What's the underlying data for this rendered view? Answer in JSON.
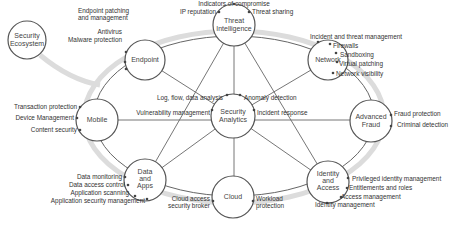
{
  "diagram": {
    "colors": {
      "ring": "#d9d9d9",
      "line": "#555555",
      "node_stroke": "#555555",
      "node_fill": "#ffffff",
      "dot": "#444444",
      "text": "#333333"
    },
    "nodes": {
      "security_ecosystem": {
        "line1": "Security",
        "line2": "Ecosystem"
      },
      "endpoint": {
        "line1": "Endpoint"
      },
      "threat_intelligence": {
        "line1": "Threat",
        "line2": "Intelligence"
      },
      "network": {
        "line1": "Network"
      },
      "mobile": {
        "line1": "Mobile"
      },
      "security_analytics": {
        "line1": "Security",
        "line2": "Analytics"
      },
      "advanced_fraud": {
        "line1": "Advanced",
        "line2": "Fraud"
      },
      "data_and_apps": {
        "line1": "Data",
        "line2": "and",
        "line3": "Apps"
      },
      "cloud": {
        "line1": "Cloud"
      },
      "identity_and_access": {
        "line1": "Identity",
        "line2": "and",
        "line3": "Access"
      }
    },
    "features": {
      "endpoint": [
        "Endpoint patching",
        "and management",
        "Antivirus",
        "Malware protection"
      ],
      "threat_intelligence": [
        "Indicators of compromise",
        "IP reputation",
        "Threat sharing"
      ],
      "network": [
        "Incident and threat management",
        "Firewalls",
        "Sandboxing",
        "Virtual patching",
        "Network visibility"
      ],
      "mobile": [
        "Transaction protection",
        "Device Management",
        "Content security"
      ],
      "security_analytics": [
        "Log, flow, data analysis",
        "Anomaly detection",
        "Vulnerability management",
        "Incident response"
      ],
      "advanced_fraud": [
        "Fraud protection",
        "Criminal detection"
      ],
      "data_and_apps": [
        "Data monitoring",
        "Data access control",
        "Application scanning",
        "Application security management"
      ],
      "cloud": [
        "Cloud access",
        "security broker",
        "Workload",
        "protection"
      ],
      "identity_and_access": [
        "Privileged identity management",
        "Entitlements and roles",
        "Access management",
        "Identity management"
      ]
    }
  }
}
